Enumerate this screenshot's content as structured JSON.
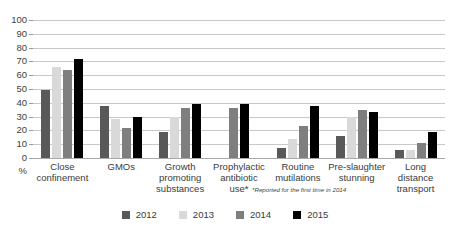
{
  "chart_data": {
    "type": "bar",
    "title": "",
    "xlabel": "",
    "ylabel": "%",
    "ylim": [
      0,
      100
    ],
    "ytick_step": 10,
    "yticks": [
      100,
      90,
      80,
      70,
      60,
      50,
      40,
      30,
      20,
      10,
      0
    ],
    "unit_label": "%",
    "grid": true,
    "legend_position": "bottom",
    "categories": [
      "Close\nconfinement",
      "GMOs",
      "Growth\npromoting\nsubstances",
      "Prophylactic\nantibiotic\nuse*",
      "Routine\nmutilations",
      "Pre-slaughter\nstunning",
      "Long\ndistance\ntransport"
    ],
    "series": [
      {
        "name": "2012",
        "color": "#595959",
        "values": [
          49,
          38,
          19,
          null,
          7,
          16,
          6
        ]
      },
      {
        "name": "2013",
        "color": "#d9d9d9",
        "values": [
          66,
          28,
          30,
          null,
          14,
          30,
          6
        ]
      },
      {
        "name": "2014",
        "color": "#7f7f7f",
        "values": [
          64,
          22,
          36,
          36,
          23,
          35,
          11
        ]
      },
      {
        "name": "2015",
        "color": "#000000",
        "values": [
          72,
          30,
          39,
          39,
          38,
          33,
          19
        ]
      }
    ],
    "annotations": [
      "*Reported for the first time in 2014"
    ]
  },
  "legend": {
    "items": [
      {
        "label": "2012",
        "color": "#595959"
      },
      {
        "label": "2013",
        "color": "#d9d9d9"
      },
      {
        "label": "2014",
        "color": "#7f7f7f"
      },
      {
        "label": "2015",
        "color": "#000000"
      }
    ]
  }
}
